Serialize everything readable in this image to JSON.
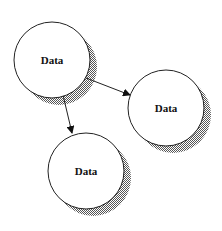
{
  "diagram": {
    "type": "data-flow",
    "colors": {
      "stroke": "#222222",
      "fill": "#ffffff",
      "shadow": "#9a9a9a"
    },
    "nodes": [
      {
        "id": "n1",
        "label": "Data",
        "cx": 52,
        "cy": 60,
        "r": 38
      },
      {
        "id": "n2",
        "label": "Data",
        "cx": 166,
        "cy": 108,
        "r": 38
      },
      {
        "id": "n3",
        "label": "Data",
        "cx": 86,
        "cy": 171,
        "r": 38
      }
    ],
    "edges": [
      {
        "from": "n1",
        "to": "n2",
        "x1": 86,
        "y1": 78,
        "x2": 130,
        "y2": 95
      },
      {
        "from": "n1",
        "to": "n3",
        "x1": 63,
        "y1": 95,
        "x2": 72,
        "y2": 133
      }
    ]
  }
}
